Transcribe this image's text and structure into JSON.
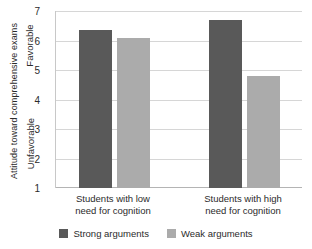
{
  "chart_data": {
    "type": "bar",
    "title": "",
    "xlabel": "",
    "ylabel": "Attitude toward comprehensive exams",
    "ylim": [
      1,
      7
    ],
    "yticks": [
      1,
      2,
      3,
      4,
      5,
      6,
      7
    ],
    "grid": true,
    "legend_position": "bottom-center",
    "scale_anchor_high": "Favorable",
    "scale_anchor_low": "Unfavorable",
    "categories": [
      "Students with low need for cognition",
      "Students with high need for cognition"
    ],
    "category_lines": [
      [
        "Students with low",
        "need for cognition"
      ],
      [
        "Students with high",
        "need for cognition"
      ]
    ],
    "series": [
      {
        "name": "Strong arguments",
        "color": "#595959",
        "values": [
          6.35,
          6.7
        ]
      },
      {
        "name": "Weak arguments",
        "color": "#ababab",
        "values": [
          6.1,
          4.8
        ]
      }
    ]
  },
  "axis": {
    "title": "Attitude toward comprehensive exams",
    "anchor_high": "Favorable",
    "anchor_low": "Unfavorable",
    "tick_labels": [
      "7",
      "6",
      "5",
      "4",
      "3",
      "2",
      "1"
    ]
  },
  "legend": {
    "items": [
      {
        "label": "Strong arguments",
        "color": "#595959"
      },
      {
        "label": "Weak arguments",
        "color": "#ababab"
      }
    ]
  },
  "colors": {
    "strong": "#595959",
    "weak": "#ababab",
    "gridline": "#d6d6d6",
    "axis": "#b4b4b4",
    "text": "#2b2b2b",
    "plot_background": "#ffffff"
  }
}
